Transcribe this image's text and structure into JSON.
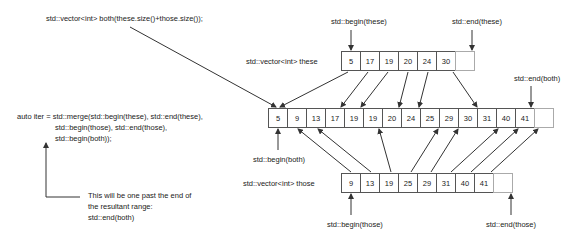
{
  "code": {
    "declaration": "std::vector<int> both(these.size()+those.size());",
    "merge_lines": [
      "auto iter = std::merge(std::begin(these), std::end(these),",
      "std::begin(those), std::end(those),",
      "std::begin(both));"
    ]
  },
  "note": {
    "lines": [
      "This will be one past the end of",
      "the resultant range:",
      "std::end(both)"
    ]
  },
  "vectors": {
    "these": {
      "label": "std::vector<int> these",
      "values": [
        "5",
        "17",
        "19",
        "20",
        "24",
        "30",
        ""
      ],
      "begin_label": "std::begin(these)",
      "end_label": "std::end(these)"
    },
    "both": {
      "values": [
        "5",
        "9",
        "13",
        "17",
        "19",
        "19",
        "20",
        "24",
        "25",
        "29",
        "30",
        "31",
        "40",
        "41",
        ""
      ],
      "begin_label": "std::begin(both)",
      "end_label": "std::end(both)"
    },
    "those": {
      "label": "std::vector<int> those",
      "values": [
        "9",
        "13",
        "19",
        "25",
        "29",
        "31",
        "40",
        "41",
        ""
      ],
      "begin_label": "std::begin(those)",
      "end_label": "std::end(those)"
    }
  },
  "colors": {
    "line": "#333333",
    "box_border": "#555555",
    "empty_box_border": "#aaaaaa",
    "text": "#222222"
  }
}
